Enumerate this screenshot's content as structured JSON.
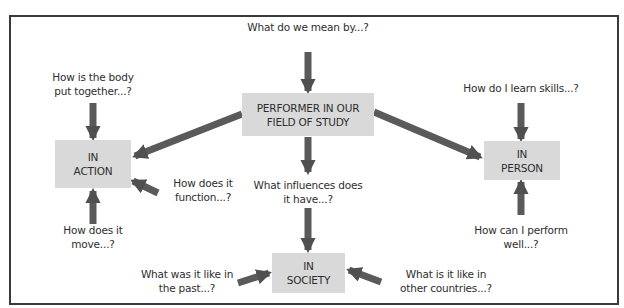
{
  "diagram": {
    "title_question": "What do we mean by...?",
    "center": {
      "line1": "PERFORMER IN OUR",
      "line2": "FIELD OF STUDY"
    },
    "nodes": {
      "action": {
        "line1": "IN",
        "line2": "ACTION"
      },
      "person": {
        "line1": "IN",
        "line2": "PERSON"
      },
      "society": {
        "line1": "IN",
        "line2": "SOCIETY"
      }
    },
    "questions": {
      "body_together": {
        "line1": "How is the body",
        "line2": "put together...?"
      },
      "function": {
        "line1": "How does it",
        "line2": "function...?"
      },
      "move": {
        "line1": "How does it",
        "line2": "move...?"
      },
      "influences": {
        "line1": "What influences does",
        "line2": "it have...?"
      },
      "past": {
        "line1": "What was it like in",
        "line2": "the past...?"
      },
      "other_countries": {
        "line1": "What is it like in",
        "line2": "other countries...?"
      },
      "learn_skills": {
        "line1": "How do I learn skills...?"
      },
      "perform_well": {
        "line1": "How can I perform",
        "line2": "well...?"
      }
    },
    "colors": {
      "node_fill": "#d9d9d9",
      "arrow": "#555555",
      "border": "#3a3a3a",
      "text": "#2e2e2e"
    }
  }
}
